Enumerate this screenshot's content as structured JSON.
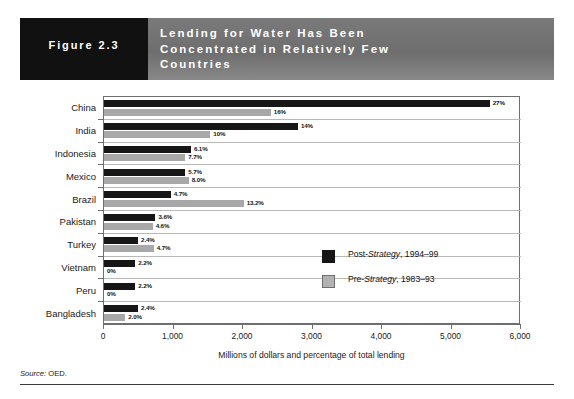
{
  "header": {
    "figure_number": "Figure 2.3",
    "title_lines": [
      "Lending for Water Has Been",
      "Concentrated in Relatively Few",
      "Countries"
    ],
    "figure_box_color": "#111111",
    "band_color": "#757575"
  },
  "legend": {
    "items": [
      {
        "label_prefix": "Post-",
        "label_em": "Strategy",
        "label_suffix": ", 1994–99",
        "color": "#161616",
        "key": "post"
      },
      {
        "label_prefix": "Pre-",
        "label_em": "Strategy",
        "label_suffix": ", 1983–93",
        "color": "#a8a8a8",
        "key": "pre"
      }
    ]
  },
  "source": {
    "label": "Source:",
    "value": "OED."
  },
  "chart_data": {
    "type": "bar",
    "orientation": "horizontal",
    "title": "Lending for Water Has Been Concentrated in Relatively Few Countries",
    "xlabel": "Millions of dollars and percentage of total lending",
    "ylabel": "",
    "xlim": [
      0,
      6000
    ],
    "xticks": [
      0,
      1000,
      2000,
      3000,
      4000,
      5000,
      6000
    ],
    "xtick_labels": [
      "0",
      "1,000",
      "2,000",
      "3,000",
      "4,000",
      "5,000",
      "6,000"
    ],
    "grid": true,
    "legend_position": "inside-right-middle",
    "categories": [
      "China",
      "India",
      "Indonesia",
      "Mexico",
      "Brazil",
      "Pakistan",
      "Turkey",
      "Vietnam",
      "Peru",
      "Bangladesh"
    ],
    "series": [
      {
        "name": "Post-Strategy, 1994–99",
        "color": "#161616",
        "values": [
          5550,
          2790,
          1250,
          1170,
          960,
          740,
          490,
          450,
          450,
          490
        ],
        "data_labels": [
          "27%",
          "14%",
          "6.1%",
          "5.7%",
          "4.7%",
          "3.6%",
          "2.4%",
          "2.2%",
          "2.2%",
          "2.4%"
        ]
      },
      {
        "name": "Pre-Strategy, 1983–93",
        "color": "#a8a8a8",
        "values": [
          2400,
          1530,
          1170,
          1220,
          2010,
          700,
          715,
          0,
          0,
          305
        ],
        "data_labels": [
          "16%",
          "10%",
          "7.7%",
          "8.0%",
          "13.2%",
          "4.6%",
          "4.7%",
          "0%",
          "0%",
          "2.0%"
        ]
      }
    ]
  }
}
